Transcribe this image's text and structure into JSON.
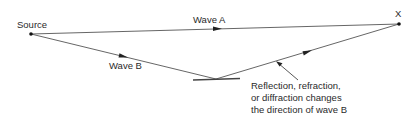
{
  "diagram": {
    "type": "multipath-propagation",
    "nodes": {
      "source": {
        "label": "Source",
        "x": 31,
        "y": 34
      },
      "receiver": {
        "label": "X",
        "x": 399,
        "y": 24
      },
      "reflector": {
        "x": 216,
        "y": 79
      }
    },
    "paths": [
      {
        "label": "Wave A",
        "from": "source",
        "to": "receiver"
      },
      {
        "label": "Wave B",
        "from": "source",
        "via": "reflector",
        "to": "receiver"
      }
    ],
    "annotation": {
      "lines": [
        "Reflection, refraction,",
        "or diffraction changes",
        "the direction of wave B"
      ]
    },
    "colors": {
      "line": "#333333",
      "text": "#2a2a2a",
      "background": "#ffffff"
    }
  }
}
